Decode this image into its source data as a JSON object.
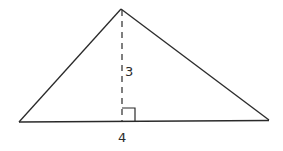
{
  "figure": {
    "shape": "triangle",
    "vertices": {
      "apex": [
        121,
        9
      ],
      "left": [
        19,
        122
      ],
      "right": [
        269,
        120
      ]
    },
    "altitude": {
      "style": "dashed",
      "foot": [
        122,
        121
      ],
      "right_angle_marker": true
    },
    "labels": {
      "height": "3",
      "base": "4"
    },
    "colors": {
      "stroke": "#2a2a2a",
      "background": "#ffffff"
    }
  }
}
